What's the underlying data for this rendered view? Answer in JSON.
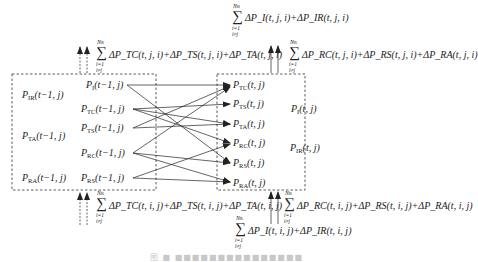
{
  "diagram": {
    "left_box": {
      "aggregate_labels": [
        {
          "text": "P",
          "sub": "IR",
          "arg": "(t−1, j)"
        },
        {
          "text": "P",
          "sub": "TA",
          "arg": "(t−1, j)"
        },
        {
          "text": "P",
          "sub": "RA",
          "arg": "(t−1, j)"
        }
      ],
      "source_nodes": [
        {
          "text": "P",
          "sub": "I",
          "arg": "(t−1, j)"
        },
        {
          "text": "P",
          "sub": "TC",
          "arg": "(t−1, j)"
        },
        {
          "text": "P",
          "sub": "TS",
          "arg": "(t−1, j)"
        },
        {
          "text": "P",
          "sub": "RC",
          "arg": "(t−1, j)"
        },
        {
          "text": "P",
          "sub": "RS",
          "arg": "(t−1, j)"
        }
      ]
    },
    "right_box": {
      "target_nodes": [
        {
          "text": "P",
          "sub": "TC",
          "arg": "(t, j)"
        },
        {
          "text": "P",
          "sub": "TS",
          "arg": "(t, j)"
        },
        {
          "text": "P",
          "sub": "TA",
          "arg": "(t, j)"
        },
        {
          "text": "P",
          "sub": "RC",
          "arg": "(t, j)"
        },
        {
          "text": "P",
          "sub": "RS",
          "arg": "(t, j)"
        },
        {
          "text": "P",
          "sub": "RA",
          "arg": "(t, j)"
        }
      ],
      "aggregate_labels": [
        {
          "text": "P",
          "sub": "I",
          "arg": "(t, j)"
        },
        {
          "text": "P",
          "sub": "IR",
          "arg": "(t, j)"
        }
      ]
    },
    "transitions": [
      {
        "from": "P_I(t-1,j)",
        "to": "P_TC(t,j)"
      },
      {
        "from": "P_I(t-1,j)",
        "to": "P_RS(t,j)"
      },
      {
        "from": "P_TC(t-1,j)",
        "to": "P_TS(t,j)"
      },
      {
        "from": "P_TC(t-1,j)",
        "to": "P_TA(t,j)"
      },
      {
        "from": "P_TC(t-1,j)",
        "to": "P_RC(t,j)"
      },
      {
        "from": "P_TS(t-1,j)",
        "to": "P_TC(t,j)"
      },
      {
        "from": "P_TS(t-1,j)",
        "to": "P_TA(t,j)"
      },
      {
        "from": "P_RC(t-1,j)",
        "to": "P_TC(t,j)"
      },
      {
        "from": "P_RC(t-1,j)",
        "to": "P_RS(t,j)"
      },
      {
        "from": "P_RC(t-1,j)",
        "to": "P_RA(t,j)"
      },
      {
        "from": "P_RS(t-1,j)",
        "to": "P_RC(t,j)"
      },
      {
        "from": "P_RS(t-1,j)",
        "to": "P_RA(t,j)"
      }
    ],
    "flows": {
      "sum_upper": "N",
      "sum_upper_sub": "R",
      "sum_lower_1": "i=1",
      "sum_lower_2": "i≠j",
      "top_left": "ΔP_TC(t, j, i)+ΔP_TS(t, j, i)+ΔP_TA(t, j, i)",
      "top_right_upper": "ΔP_I(t, j, i)+ΔP_IR(t, j, i)",
      "top_right_lower": "ΔP_RC(t, j, i)+ΔP_RS(t, j, i)+ΔP_RA(t, j, i)",
      "bottom_left": "ΔP_TC(t, i, j)+ΔP_TS(t, i, j)+ΔP_TA(t, i, j)",
      "bottom_right_upper": "ΔP_RC(t, i, j)+ΔP_RS(t, i, j)+ΔP_RA(t, i, j)",
      "bottom_right_lower": "ΔP_I(t, i, j)+ΔP_IR(t, i, j)"
    },
    "caption": "图 ■ ■■■■■■■■■■■■■■■"
  }
}
